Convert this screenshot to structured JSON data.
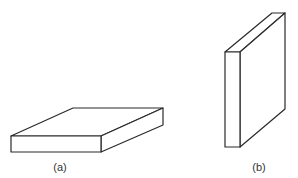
{
  "figure": {
    "panels": [
      {
        "id": "a",
        "label": "(a)",
        "description": "Flat slab lying horizontally",
        "front_face": [
          [
            11,
            136
          ],
          [
            101,
            136
          ],
          [
            101,
            152
          ],
          [
            11,
            152
          ]
        ],
        "top_face": [
          [
            11,
            136
          ],
          [
            73,
            108
          ],
          [
            163,
            108
          ],
          [
            101,
            136
          ]
        ],
        "side_face": [
          [
            101,
            136
          ],
          [
            163,
            108
          ],
          [
            163,
            125
          ],
          [
            101,
            152
          ]
        ],
        "label_pos": [
          60,
          171
        ]
      },
      {
        "id": "b",
        "label": "(b)",
        "description": "Slab standing vertically",
        "front_face": [
          [
            225,
            52
          ],
          [
            240,
            52
          ],
          [
            240,
            147
          ],
          [
            225,
            147
          ]
        ],
        "top_face": [
          [
            225,
            52
          ],
          [
            272,
            13
          ],
          [
            285,
            13
          ],
          [
            240,
            52
          ]
        ],
        "side_face": [
          [
            240,
            52
          ],
          [
            285,
            13
          ],
          [
            285,
            109
          ],
          [
            240,
            147
          ]
        ],
        "label_pos": [
          259,
          171
        ]
      }
    ],
    "stroke_color": "#2a2a2a",
    "background": "#ffffff"
  }
}
